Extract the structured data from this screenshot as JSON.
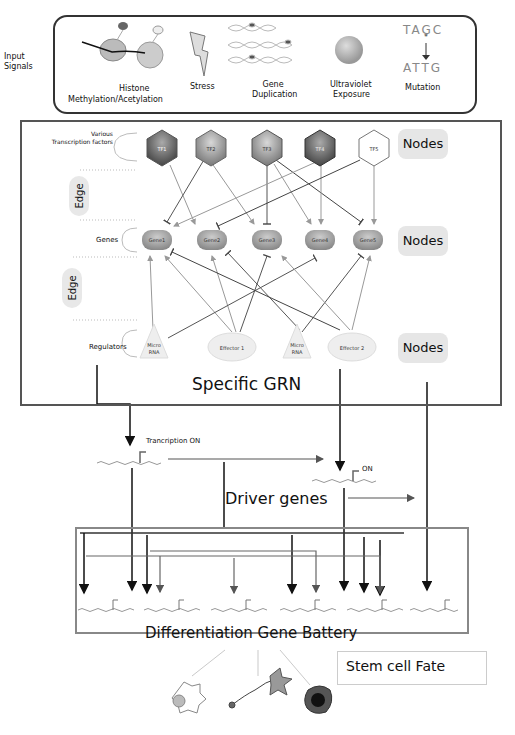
{
  "input_signals": {
    "label_line1": "Input",
    "label_line2": "Signals",
    "items": [
      {
        "line1": "Histone",
        "line2": "Methylation/Acetylation",
        "icon": "histone-icon"
      },
      {
        "line1": "Stress",
        "line2": "",
        "icon": "lightning-icon"
      },
      {
        "line1": "Gene",
        "line2": "Duplication",
        "icon": "dna-helix-icon"
      },
      {
        "line1": "Ultraviolet",
        "line2": "Exposure",
        "icon": "uv-sphere-icon"
      },
      {
        "line1": "Mutation",
        "line2": "",
        "icon": "mutation-icon"
      }
    ],
    "mutation_seq_top": "TAGC",
    "mutation_seq_bottom": "ATTG"
  },
  "grn": {
    "title": "Specific GRN",
    "tf_label_line1": "Various",
    "tf_label_line2": "Transcription factors",
    "genes_label": "Genes",
    "regulators_label": "Regulators",
    "edge_label": "Edge",
    "nodes_label": "Nodes",
    "transcription_factors": [
      "TF1",
      "TF2",
      "TF3",
      "TF4",
      "TF5"
    ],
    "genes": [
      "Gene1",
      "Gene2",
      "Gene3",
      "Gene4",
      "Gene5"
    ],
    "regulators": [
      {
        "line1": "Micro",
        "line2": "RNA",
        "shape": "triangle"
      },
      {
        "line1": "Effector 1",
        "line2": "",
        "shape": "ellipse"
      },
      {
        "line1": "Micro",
        "line2": "RNA",
        "shape": "triangle"
      },
      {
        "line1": "Effector 2",
        "line2": "",
        "shape": "ellipse"
      }
    ]
  },
  "driver": {
    "transcription_on": "Trancription ON",
    "on": "ON",
    "title": "Driver genes"
  },
  "battery": {
    "title": "Differentiation Gene Battery",
    "gene_count": 7
  },
  "fate": {
    "title": "Stem cell Fate",
    "cells": [
      "flower-cell-icon",
      "neuron-icon",
      "dark-cell-icon"
    ]
  }
}
